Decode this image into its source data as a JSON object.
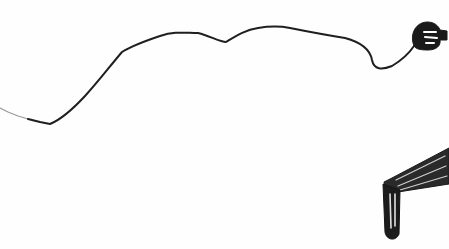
{
  "sketch": {
    "description": "Hand-drawn ink sketch: a wavy cord across the page ending in a plug/hand shape at top right, and a dripping tap/pipe shape at bottom right",
    "ink_color": "#1a1a1a",
    "background": "#fefefe",
    "elements": [
      {
        "name": "cord-line"
      },
      {
        "name": "plug-end"
      },
      {
        "name": "dripping-pipe"
      }
    ]
  }
}
